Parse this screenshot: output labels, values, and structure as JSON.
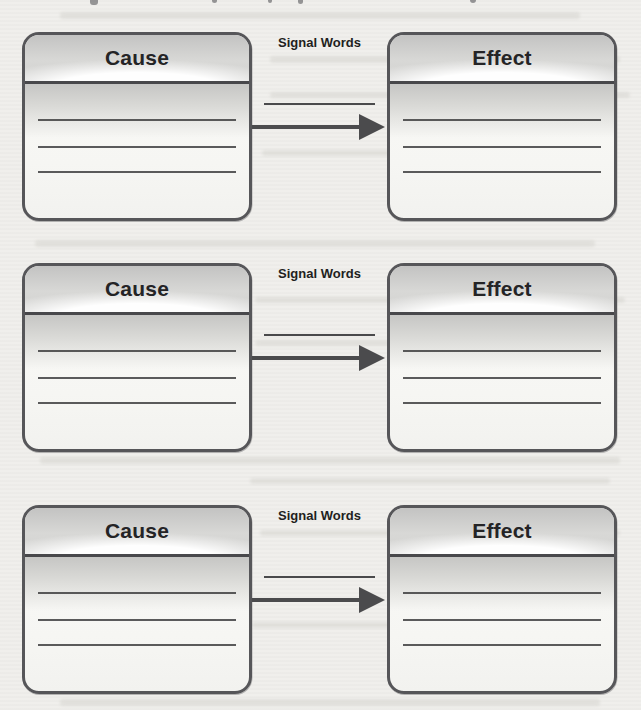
{
  "organizer": {
    "rows": [
      {
        "cause_label": "Cause",
        "signal_words_label": "Signal Words",
        "effect_label": "Effect"
      },
      {
        "cause_label": "Cause",
        "signal_words_label": "Signal Words",
        "effect_label": "Effect"
      },
      {
        "cause_label": "Cause",
        "signal_words_label": "Signal Words",
        "effect_label": "Effect"
      }
    ],
    "writing_lines_per_box": 3,
    "signal_word_blank_lines_per_row": 1
  },
  "colors": {
    "page_background": "#f0efec",
    "box_border": "#565659",
    "divider": "#48484b",
    "writing_line": "#3e3e40",
    "arrow": "#4b4b4d",
    "title_text": "#242426",
    "label_text": "#1f1f21"
  }
}
